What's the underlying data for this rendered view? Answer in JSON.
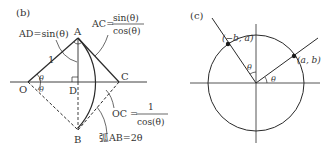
{
  "figure_b": {
    "label": "(b)",
    "points": {
      "O": "O",
      "A": "A",
      "B": "B",
      "C": "C",
      "D": "D"
    },
    "side_label": "1",
    "theta": "θ",
    "ad_label": "AD=sin(θ)",
    "ac_label": "AC=",
    "ac_num": "sin(θ)",
    "ac_den": "cos(θ)",
    "oc_label": "OC =",
    "oc_num": "1",
    "oc_den": "cos(θ)",
    "arc_label": "弧AB=2θ"
  },
  "figure_c": {
    "label": "(c)",
    "point1": "(−b, a)",
    "point2": "(a, b)",
    "theta": "θ"
  },
  "colors": {
    "line": "#2a2a2a",
    "text": "#333333",
    "background": "#ffffff"
  }
}
